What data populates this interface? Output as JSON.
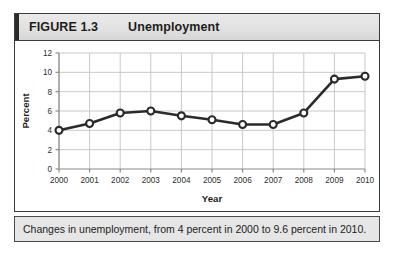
{
  "figure": {
    "label": "FIGURE 1.3",
    "title": "Unemployment",
    "caption": "Changes in unemployment, from 4 percent in 2000 to 9.6 percent in 2010."
  },
  "colors": {
    "line": "#2b2b2b",
    "marker_fill": "#ffffff",
    "marker_stroke": "#2b2b2b",
    "grid": "#c9c9c9",
    "axis": "#8a8a8a",
    "frame": "#3b3b3b",
    "header_bg": "#e4e4e4",
    "caption_bg": "#e6e6e6",
    "text": "#1d1d1d"
  },
  "chart_data": {
    "type": "line",
    "title": "Unemployment",
    "xlabel": "Year",
    "ylabel": "Percent",
    "x": [
      2000,
      2001,
      2002,
      2003,
      2004,
      2005,
      2006,
      2007,
      2008,
      2009,
      2010
    ],
    "values": [
      4.0,
      4.7,
      5.8,
      6.0,
      5.5,
      5.1,
      4.6,
      4.6,
      5.8,
      9.3,
      9.6
    ],
    "xtick_labels": [
      "2000",
      "2001",
      "2002",
      "2003",
      "2004",
      "2005",
      "2006",
      "2007",
      "2008",
      "2009",
      "2010"
    ],
    "ytick_labels": [
      "0",
      "2",
      "4",
      "6",
      "8",
      "10",
      "12"
    ],
    "yticks": [
      0,
      2,
      4,
      6,
      8,
      10,
      12
    ],
    "ylim": [
      0,
      12
    ],
    "xlim": [
      2000,
      2010
    ],
    "grid": true,
    "legend": "none",
    "marker": "open-circle"
  }
}
